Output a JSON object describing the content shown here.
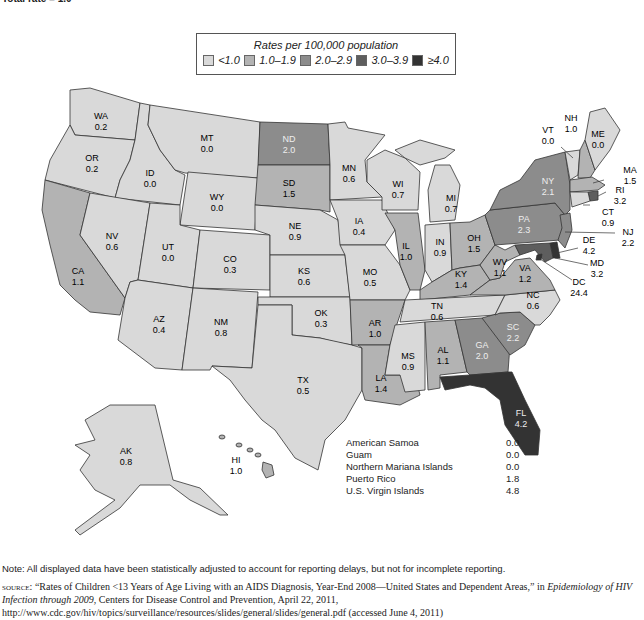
{
  "header": {
    "total_rate": "Total rate = 1.0"
  },
  "legend": {
    "title": "Rates per 100,000 population",
    "items": [
      {
        "label": "<1.0",
        "color": "#d9d9d9"
      },
      {
        "label": "1.0–1.9",
        "color": "#b3b3b3"
      },
      {
        "label": "2.0–2.9",
        "color": "#8c8c8c"
      },
      {
        "label": "3.0–3.9",
        "color": "#5e5e5e"
      },
      {
        "label": "≥4.0",
        "color": "#333333"
      }
    ]
  },
  "states": {
    "WA": {
      "label": "WA",
      "value": "0.2"
    },
    "OR": {
      "label": "OR",
      "value": "0.2"
    },
    "CA": {
      "label": "CA",
      "value": "1.1"
    },
    "ID": {
      "label": "ID",
      "value": "0.0"
    },
    "NV": {
      "label": "NV",
      "value": "0.6"
    },
    "MT": {
      "label": "MT",
      "value": "0.0"
    },
    "WY": {
      "label": "WY",
      "value": "0.0"
    },
    "UT": {
      "label": "UT",
      "value": "0.0"
    },
    "AZ": {
      "label": "AZ",
      "value": "0.4"
    },
    "CO": {
      "label": "CO",
      "value": "0.3"
    },
    "NM": {
      "label": "NM",
      "value": "0.8"
    },
    "ND": {
      "label": "ND",
      "value": "2.0"
    },
    "SD": {
      "label": "SD",
      "value": "1.5"
    },
    "NE": {
      "label": "NE",
      "value": "0.9"
    },
    "KS": {
      "label": "KS",
      "value": "0.6"
    },
    "OK": {
      "label": "OK",
      "value": "0.3"
    },
    "TX": {
      "label": "TX",
      "value": "0.5"
    },
    "MN": {
      "label": "MN",
      "value": "0.6"
    },
    "IA": {
      "label": "IA",
      "value": "0.4"
    },
    "MO": {
      "label": "MO",
      "value": "0.5"
    },
    "AR": {
      "label": "AR",
      "value": "1.0"
    },
    "LA": {
      "label": "LA",
      "value": "1.4"
    },
    "WI": {
      "label": "WI",
      "value": "0.7"
    },
    "IL": {
      "label": "IL",
      "value": "1.0"
    },
    "MI": {
      "label": "MI",
      "value": "0.7"
    },
    "IN": {
      "label": "IN",
      "value": "0.9"
    },
    "OH": {
      "label": "OH",
      "value": "1.5"
    },
    "KY": {
      "label": "KY",
      "value": "1.4"
    },
    "TN": {
      "label": "TN",
      "value": "0.6"
    },
    "MS": {
      "label": "MS",
      "value": "0.9"
    },
    "AL": {
      "label": "AL",
      "value": "1.1"
    },
    "GA": {
      "label": "GA",
      "value": "2.0"
    },
    "FL": {
      "label": "FL",
      "value": "4.2"
    },
    "SC": {
      "label": "SC",
      "value": "2.2"
    },
    "NC": {
      "label": "NC",
      "value": "0.6"
    },
    "VA": {
      "label": "VA",
      "value": "1.2"
    },
    "WV": {
      "label": "WV",
      "value": "1.1"
    },
    "PA": {
      "label": "PA",
      "value": "2.3"
    },
    "NY": {
      "label": "NY",
      "value": "2.1"
    },
    "VT": {
      "label": "VT",
      "value": "0.0"
    },
    "NH": {
      "label": "NH",
      "value": "1.0"
    },
    "ME": {
      "label": "ME",
      "value": "0.0"
    },
    "MA": {
      "label": "MA",
      "value": "1.5"
    },
    "RI": {
      "label": "RI",
      "value": "3.2"
    },
    "CT": {
      "label": "CT",
      "value": "0.9"
    },
    "NJ": {
      "label": "NJ",
      "value": "2.2"
    },
    "DE": {
      "label": "DE",
      "value": "4.2"
    },
    "MD": {
      "label": "MD",
      "value": "3.2"
    },
    "DC": {
      "label": "DC",
      "value": "24.4"
    },
    "AK": {
      "label": "AK",
      "value": "0.8"
    },
    "HI": {
      "label": "HI",
      "value": "1.0"
    }
  },
  "territories": [
    {
      "name": "American Samoa",
      "value": "0.0"
    },
    {
      "name": "Guam",
      "value": "0.0"
    },
    {
      "name": "Northern Mariana Islands",
      "value": "0.0"
    },
    {
      "name": "Puerto Rico",
      "value": "1.8"
    },
    {
      "name": "U.S. Virgin Islands",
      "value": "4.8"
    }
  ],
  "footer": {
    "note": "Note: All displayed data have been statistically adjusted to account for reporting delays, but not for incomplete reporting.",
    "source_label": "source:",
    "source_text_1": " “Rates of Children <13 Years of Age Living with an AIDS Diagnosis, Year-End 2008—United States and Dependent Areas,” in ",
    "source_italic": "Epidemiology of HIV Infection through 2009",
    "source_text_2": ", Centers for Disease Control and Prevention, April 22, 2011, http://www.cdc.gov/hiv/topics/surveillance/resources/slides/general/slides/general.pdf (accessed June 4, 2011)"
  }
}
